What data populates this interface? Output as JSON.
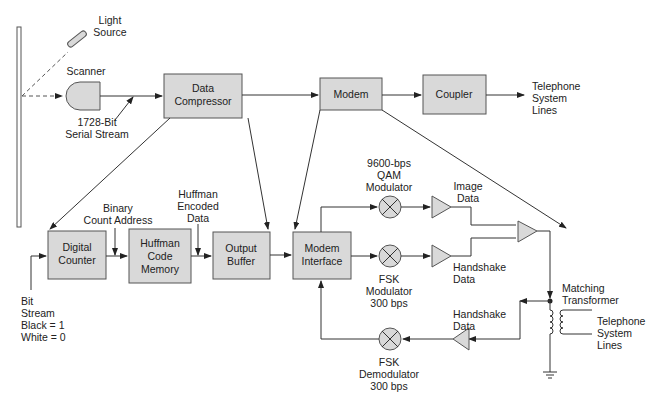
{
  "diagram": {
    "type": "block-diagram",
    "title": "",
    "blocks": {
      "data_compressor": {
        "lines": [
          "Data",
          "Compressor"
        ]
      },
      "modem": {
        "lines": [
          "Modem"
        ]
      },
      "coupler": {
        "lines": [
          "Coupler"
        ]
      },
      "digital_counter": {
        "lines": [
          "Digital",
          "Counter"
        ]
      },
      "huffman_code_memory": {
        "lines": [
          "Huffman",
          "Code",
          "Memory"
        ]
      },
      "output_buffer": {
        "lines": [
          "Output",
          "Buffer"
        ]
      },
      "modem_interface": {
        "lines": [
          "Modem",
          "Interface"
        ]
      }
    },
    "labels": {
      "light_source": [
        "Light",
        "Source"
      ],
      "scanner": [
        "Scanner"
      ],
      "serial_stream": [
        "1728-Bit",
        "Serial Stream"
      ],
      "telephone_top": [
        "Telephone",
        "System",
        "Lines"
      ],
      "binary_count_address": [
        "Binary",
        "Count Address"
      ],
      "huffman_encoded_data": [
        "Huffman",
        "Encoded",
        "Data"
      ],
      "bit_stream": [
        "Bit",
        "Stream",
        "Black = 1",
        "White = 0"
      ],
      "qam_modulator": [
        "9600-bps",
        "QAM",
        "Modulator"
      ],
      "fsk_modulator": [
        "FSK",
        "Modulator",
        "300 bps"
      ],
      "image_data": [
        "Image",
        "Data"
      ],
      "handshake_data_tx": [
        "Handshake",
        "Data"
      ],
      "handshake_data_rx": [
        "Handshake",
        "Data"
      ],
      "matching_transformer": [
        "Matching",
        "Transformer"
      ],
      "telephone_bottom": [
        "Telephone",
        "System",
        "Lines"
      ],
      "fsk_demodulator": [
        "FSK",
        "Demodulator",
        "300 bps"
      ]
    },
    "connections": [
      [
        "scanner",
        "data_compressor"
      ],
      [
        "data_compressor",
        "modem"
      ],
      [
        "modem",
        "coupler"
      ],
      [
        "coupler",
        "telephone_top"
      ],
      [
        "data_compressor",
        "digital_counter"
      ],
      [
        "data_compressor",
        "output_buffer"
      ],
      [
        "modem",
        "modem_interface"
      ],
      [
        "modem",
        "matching_transformer"
      ],
      [
        "bit_stream",
        "digital_counter"
      ],
      [
        "digital_counter",
        "huffman_code_memory"
      ],
      [
        "huffman_code_memory",
        "output_buffer"
      ],
      [
        "output_buffer",
        "modem_interface"
      ],
      [
        "modem_interface",
        "qam_modulator"
      ],
      [
        "modem_interface",
        "fsk_modulator"
      ],
      [
        "qam_modulator",
        "image_amp"
      ],
      [
        "fsk_modulator",
        "handshake_amp"
      ],
      [
        "image_amp",
        "summing_amp"
      ],
      [
        "handshake_amp",
        "summing_amp"
      ],
      [
        "summing_amp",
        "matching_transformer"
      ],
      [
        "matching_transformer",
        "receive_amp"
      ],
      [
        "receive_amp",
        "fsk_demodulator"
      ],
      [
        "fsk_demodulator",
        "modem_interface"
      ]
    ]
  }
}
